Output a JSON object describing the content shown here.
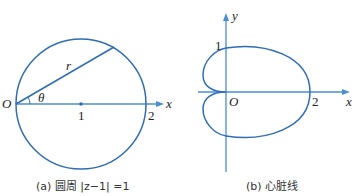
{
  "figure_a": {
    "caption": "(a) 圆周 |z−1| =1",
    "labels": {
      "origin": "O",
      "radius": "r",
      "angle": "θ",
      "center": "1",
      "point2": "2",
      "x_axis": "x"
    }
  },
  "figure_b": {
    "caption": "(b) 心脏线",
    "labels": {
      "origin": "O",
      "y_tick": "1",
      "x_tick": "2",
      "x_axis": "x",
      "y_axis": "y"
    }
  },
  "colors": {
    "curve": "#2e6db4",
    "axis": "#4a8fd0",
    "text": "#222222"
  }
}
